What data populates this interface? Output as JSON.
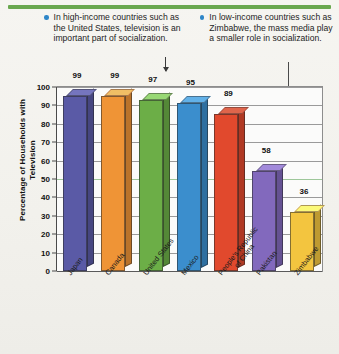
{
  "header": {
    "rule_color": "#6aa84f"
  },
  "callouts": [
    {
      "id": "high-income",
      "text": "In high-income countries such as the United States, television is an important part of socialization.",
      "bullet_color": "#2e86c8",
      "points_to": "United States"
    },
    {
      "id": "low-income",
      "text": "In low-income countries such as Zimbabwe, the mass media play a smaller role in socialization.",
      "bullet_color": "#2e86c8",
      "points_to": "Zimbabwe"
    }
  ],
  "chart_data": {
    "type": "bar",
    "title": "",
    "xlabel": "",
    "ylabel": "Percentage of Households with Television",
    "categories": [
      "Japan",
      "Canada",
      "United States",
      "Mexico",
      "People's Republic of China",
      "Pakistan",
      "Zimbabwe"
    ],
    "category_lines": [
      [
        "Japan"
      ],
      [
        "Canada"
      ],
      [
        "United States"
      ],
      [
        "Mexico"
      ],
      [
        "People's Republic",
        "of China"
      ],
      [
        "Pakistan"
      ],
      [
        "Zimbabwe"
      ]
    ],
    "values": [
      99,
      99,
      97,
      95,
      89,
      58,
      36
    ],
    "bar_colors": [
      "#5a5aa6",
      "#ef9436",
      "#6cae47",
      "#3b8ecd",
      "#e1492d",
      "#8269bd",
      "#f3c53f"
    ],
    "ylim": [
      0,
      100
    ],
    "yticks": [
      0,
      10,
      20,
      30,
      40,
      50,
      60,
      70,
      80,
      90,
      100
    ],
    "grid": true,
    "legend": "none"
  }
}
